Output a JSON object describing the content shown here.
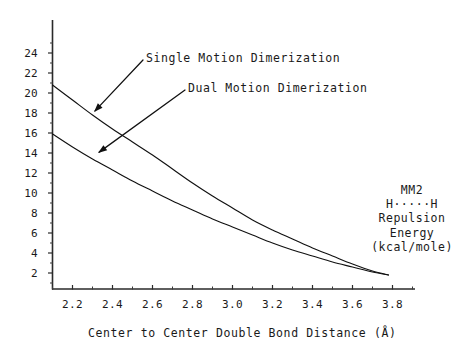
{
  "chart_data": {
    "type": "line",
    "title": "",
    "xlabel": "Center to Center Double Bond Distance (Å)",
    "ylabel": "",
    "xlim": [
      2.1,
      3.9
    ],
    "ylim": [
      0,
      25.5
    ],
    "grid": false,
    "legend_position": "inline-annotations",
    "xticks": [
      "2.2",
      "2.4",
      "2.6",
      "2.8",
      "3.0",
      "3.2",
      "3.4",
      "3.6",
      "3.8"
    ],
    "xtick_values": [
      2.2,
      2.4,
      2.6,
      2.8,
      3.0,
      3.2,
      3.4,
      3.6,
      3.8
    ],
    "xminor_step": 0.1,
    "yticks": [
      "2",
      "4",
      "6",
      "8",
      "10",
      "12",
      "14",
      "16",
      "18",
      "20",
      "22",
      "24"
    ],
    "ytick_values": [
      2,
      4,
      6,
      8,
      10,
      12,
      14,
      16,
      18,
      20,
      22,
      24
    ],
    "yminor_step": 1,
    "series": [
      {
        "name": "Single Motion Dimerization",
        "color": "#111111",
        "x": [
          2.1,
          2.2,
          2.3,
          2.4,
          2.5,
          2.6,
          2.7,
          2.8,
          2.9,
          3.0,
          3.1,
          3.2,
          3.3,
          3.4,
          3.5,
          3.6,
          3.7,
          3.78
        ],
        "values": [
          20.8,
          19.3,
          17.8,
          16.4,
          15.1,
          13.8,
          12.4,
          11.0,
          9.7,
          8.5,
          7.3,
          6.3,
          5.4,
          4.5,
          3.7,
          2.9,
          2.2,
          1.8
        ]
      },
      {
        "name": "Dual Motion Dimerization",
        "color": "#111111",
        "x": [
          2.1,
          2.2,
          2.3,
          2.4,
          2.5,
          2.6,
          2.7,
          2.8,
          2.9,
          3.0,
          3.1,
          3.2,
          3.3,
          3.4,
          3.5,
          3.6,
          3.7,
          3.78
        ],
        "values": [
          15.9,
          14.6,
          13.4,
          12.3,
          11.2,
          10.2,
          9.2,
          8.3,
          7.4,
          6.6,
          5.8,
          5.0,
          4.3,
          3.7,
          3.1,
          2.6,
          2.1,
          1.8
        ]
      }
    ],
    "annotations": [
      {
        "text": "Single Motion Dimerization",
        "text_x": 146,
        "text_y": 52,
        "arrow_from_x": 143,
        "arrow_from_y": 60,
        "arrow_to_x": 94,
        "arrow_to_y": 112
      },
      {
        "text": "Dual Motion Dimerization",
        "text_x": 188,
        "text_y": 82,
        "arrow_from_x": 185,
        "arrow_from_y": 90,
        "arrow_to_x": 98,
        "arrow_to_y": 153
      }
    ],
    "corner_note": {
      "lines": [
        "MM2",
        "H·····H",
        "Repulsion",
        "Energy",
        "(kcal/mole)"
      ]
    }
  }
}
